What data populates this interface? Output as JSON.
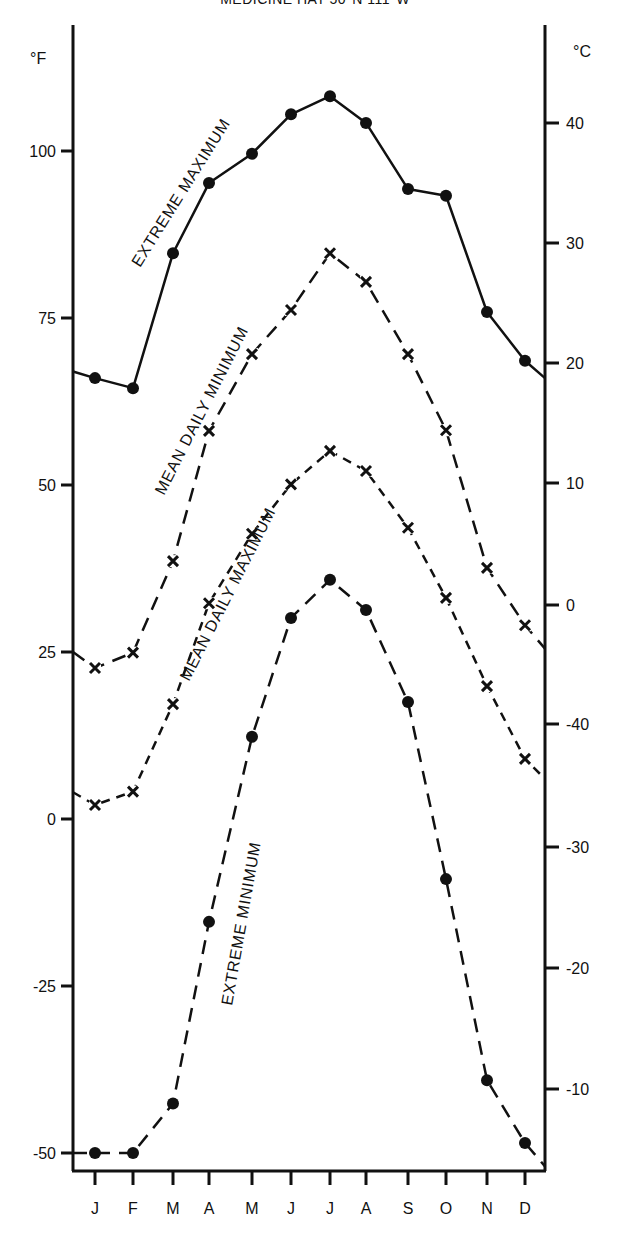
{
  "title": "MEDICINE HAT 50°N 111°W",
  "chart_data": {
    "type": "line",
    "title": "MEDICINE HAT 50°N 111°W",
    "xlabel": "",
    "ylabel_left": "°F",
    "ylabel_right": "°C",
    "categories": [
      "J",
      "F",
      "M",
      "A",
      "M",
      "J",
      "J",
      "A",
      "S",
      "O",
      "N",
      "D"
    ],
    "left_axis": {
      "label": "°F",
      "ticks": [
        100,
        75,
        50,
        25,
        0,
        -25,
        -50
      ],
      "ylim": [
        -52,
        115
      ]
    },
    "right_axis": {
      "label": "°C",
      "tick_labels": [
        "40",
        "30",
        "20",
        "10",
        "0",
        "-40",
        "-30",
        "-20",
        "-10"
      ]
    },
    "grid": false,
    "legend": "inline labels along curves",
    "series": [
      {
        "name": "EXTREME MAXIMUM",
        "style": "solid",
        "marker": "dot",
        "values": [
          66,
          64.5,
          84.7,
          95.2,
          99.6,
          105.5,
          108.2,
          104.2,
          94.3,
          93.3,
          75.9,
          68.6
        ],
        "start_edge": 67,
        "end_edge": 66
      },
      {
        "name": "MEAN DAILY MINIMUM",
        "style": "long-dash",
        "marker": "cross",
        "values": [
          22.6,
          24.9,
          38.6,
          58.1,
          69.6,
          76.2,
          84.7,
          80.4,
          69.6,
          58.2,
          37.6,
          29.0
        ],
        "start_edge": 25,
        "end_edge": 25.5
      },
      {
        "name": "MEAN DAILY MAXIMUM",
        "style": "short-dash",
        "marker": "cross",
        "values": [
          2.1,
          4.1,
          17.2,
          32.3,
          42.7,
          50.1,
          55.1,
          52.1,
          43.6,
          33.1,
          19.9,
          9.0
        ],
        "start_edge": 4,
        "end_edge": 6
      },
      {
        "name": "EXTREME MINIMUM",
        "style": "long-dash",
        "marker": "dot",
        "values": [
          -50,
          -50,
          -42.6,
          -15.4,
          12.3,
          30.1,
          35.8,
          31.3,
          17.5,
          -9.0,
          -39.1,
          -48.5
        ],
        "start_edge": -50,
        "end_edge": -52
      }
    ],
    "annotations": [
      {
        "text": "EXTREME  MAXIMUM",
        "series": "EXTREME MAXIMUM"
      },
      {
        "text": "MEAN DAILY  MINIMUM",
        "series": "MEAN DAILY MINIMUM"
      },
      {
        "text": "MEAN DAILY  MAXIMUM",
        "series": "MEAN DAILY MAXIMUM"
      },
      {
        "text": "EXTREME MINIMUM",
        "series": "EXTREME MINIMUM"
      }
    ]
  }
}
